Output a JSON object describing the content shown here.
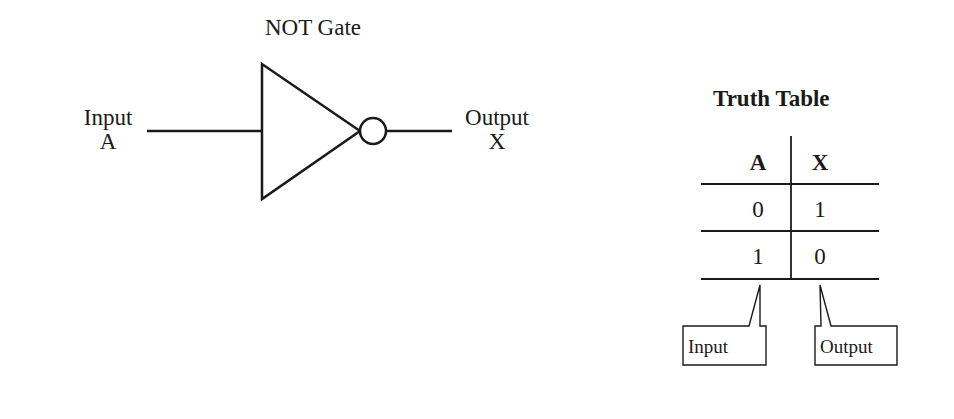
{
  "gate": {
    "title": "NOT Gate",
    "input_label": "Input",
    "input_var": "A",
    "output_label": "Output",
    "output_var": "X"
  },
  "truth_table": {
    "title": "Truth Table",
    "headers": [
      "A",
      "X"
    ],
    "rows": [
      [
        "0",
        "1"
      ],
      [
        "1",
        "0"
      ]
    ],
    "callouts": {
      "input": "Input",
      "output": "Output"
    }
  },
  "colors": {
    "stroke": "#1a1a1a",
    "background": "#ffffff"
  }
}
